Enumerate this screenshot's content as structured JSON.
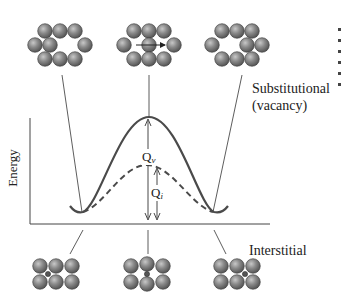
{
  "diagram": {
    "type": "energy-barrier-diffusion",
    "labels": {
      "substitutional_line1": "Substitutional",
      "substitutional_line2": "(vacancy)",
      "interstitial": "Interstitial",
      "y_axis": "Energy",
      "q_v_main": "Q",
      "q_v_sub": "v",
      "q_i_main": "Q",
      "q_i_sub": "i"
    },
    "curves": [
      {
        "name": "substitutional-vacancy",
        "style": "solid",
        "relative_barrier": "Qv (high)"
      },
      {
        "name": "interstitial",
        "style": "dashed",
        "relative_barrier": "Qi (low)"
      }
    ],
    "top_row_states": [
      "initial vacancy configuration",
      "atom jumping into vacancy (arrow)",
      "final configuration, vacancy moved"
    ],
    "bottom_row_states": [
      "interstitial atom in initial site",
      "interstitial squeezing between atoms",
      "interstitial in adjacent site"
    ],
    "colors": {
      "atom_fill": "#7a7a7a",
      "atom_highlight": "#bdbdbd",
      "atom_outline": "#3a3a3a",
      "curve": "#4a4a4a",
      "line": "#333333"
    }
  }
}
